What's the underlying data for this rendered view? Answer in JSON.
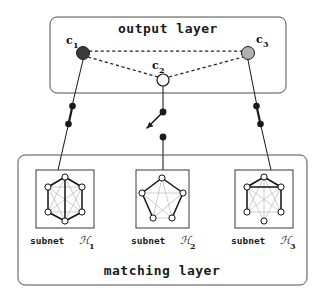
{
  "figure": {
    "width": 325,
    "height": 299,
    "background": "#ffffff"
  },
  "colors": {
    "stroke": "#1a1a1a",
    "box_border": "#4d4d4d",
    "node_filled_dark": "#3a3a3a",
    "node_filled_gray": "#b0b0b0",
    "node_empty": "#ffffff",
    "graph_edge_bold": "#1a1a1a",
    "graph_edge_light": "#b8b8b8",
    "dashed_edge": "#222222"
  },
  "output_layer": {
    "title": "output layer",
    "box": {
      "x": 50,
      "y": 17,
      "w": 236,
      "h": 76,
      "rx": 7
    },
    "nodes": [
      {
        "id": "c1",
        "label": "c",
        "subscript": "1",
        "cx": 83,
        "cy": 53,
        "r": 6.5,
        "fill": "node_filled_dark",
        "label_x": 66,
        "label_y": 43
      },
      {
        "id": "c2",
        "label": "c",
        "subscript": "2",
        "cx": 163,
        "cy": 80,
        "r": 6.0,
        "fill": "node_empty",
        "label_x": 152,
        "label_y": 68
      },
      {
        "id": "c3",
        "label": "c",
        "subscript": "3",
        "cx": 248,
        "cy": 53,
        "r": 6.5,
        "fill": "node_filled_gray",
        "label_x": 258,
        "label_y": 42
      }
    ],
    "dashed_edges": [
      {
        "from": "c1",
        "to": "c3"
      },
      {
        "from": "c1",
        "to": "c2"
      },
      {
        "from": "c2",
        "to": "c3"
      }
    ]
  },
  "matching_layer": {
    "title": "matching layer",
    "box": {
      "x": 18,
      "y": 155,
      "w": 289,
      "h": 130,
      "rx": 7
    },
    "subnets": [
      {
        "id": "H1",
        "label_prefix": "subnet",
        "label_symbol": "ℋ",
        "label_index": "1",
        "panel": {
          "x": 36,
          "y": 170,
          "w": 58,
          "h": 58
        },
        "label_x": 30,
        "label_y": 244,
        "node_count": 6,
        "graph_type": "hexagon-6",
        "bold_edges": 5
      },
      {
        "id": "H2",
        "label_prefix": "subnet",
        "label_symbol": "ℋ",
        "label_index": "2",
        "panel": {
          "x": 136,
          "y": 170,
          "w": 53,
          "h": 58
        },
        "label_x": 131,
        "label_y": 244,
        "node_count": 5,
        "graph_type": "pentagon-5",
        "bold_edges": 3
      },
      {
        "id": "H3",
        "label_prefix": "subnet",
        "label_symbol": "ℋ",
        "label_index": "3",
        "panel": {
          "x": 235,
          "y": 170,
          "w": 58,
          "h": 58
        },
        "label_x": 231,
        "label_y": 244,
        "node_count": 6,
        "graph_type": "hexagon-6",
        "bold_edges": 4
      }
    ]
  },
  "connections": [
    {
      "id": "conn-left",
      "from_node": "c1",
      "to_subnet": "H1",
      "switch_state": "closed",
      "points": [
        [
          83,
          60
        ],
        [
          72,
          105
        ],
        [
          68,
          124
        ],
        [
          60,
          170
        ]
      ]
    },
    {
      "id": "conn-middle",
      "from_node": "c2",
      "to_subnet": "H2",
      "switch_state": "open",
      "points": [
        [
          163,
          86
        ],
        [
          163,
          112
        ],
        [
          163,
          137
        ],
        [
          163,
          170
        ]
      ]
    },
    {
      "id": "conn-right",
      "from_node": "c3",
      "to_subnet": "H3",
      "switch_state": "closed",
      "points": [
        [
          248,
          60
        ],
        [
          257,
          105
        ],
        [
          261,
          124
        ],
        [
          268,
          170
        ]
      ]
    }
  ],
  "switches": [
    {
      "id": "switch-left",
      "dot_top": [
        72.5,
        106
      ],
      "dot_bottom": [
        68.5,
        124
      ],
      "type": "closed"
    },
    {
      "id": "switch-middle",
      "dot_top": [
        163,
        112
      ],
      "dot_bottom": [
        163,
        137
      ],
      "type": "open",
      "lever_end": [
        148,
        128
      ]
    },
    {
      "id": "switch-right",
      "dot_top": [
        256.5,
        106
      ],
      "dot_bottom": [
        260.5,
        124
      ],
      "type": "closed"
    }
  ]
}
